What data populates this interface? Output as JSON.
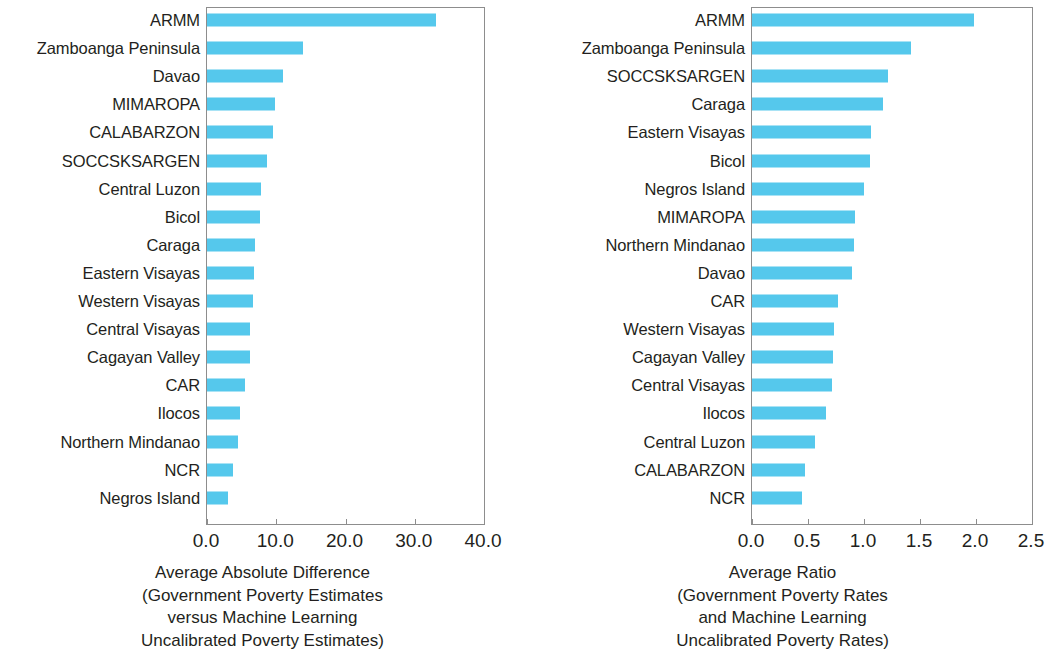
{
  "figure": {
    "background_color": "#ffffff",
    "bar_color": "#55c8ec",
    "axis_color": "#8d8d8d",
    "text_color": "#231f20"
  },
  "chart_data": [
    {
      "type": "bar",
      "orientation": "horizontal",
      "panel": "left",
      "title": "",
      "xlabel": "Average Absolute Difference (Government Poverty Estimates versus Machine Learning Uncalibrated Poverty Estimates)",
      "xlabel_lines": [
        "Average Absolute Difference",
        "(Government Poverty Estimates",
        "versus Machine Learning",
        "Uncalibrated Poverty Estimates)"
      ],
      "ylabel": "",
      "xlim": [
        0.0,
        40.0
      ],
      "xticks": [
        0.0,
        10.0,
        20.0,
        30.0,
        40.0
      ],
      "xtick_labels": [
        "0.0",
        "10.0",
        "20.0",
        "30.0",
        "40.0"
      ],
      "grid": false,
      "legend": null,
      "categories": [
        "ARMM",
        "Zamboanga Peninsula",
        "Davao",
        "MIMAROPA",
        "CALABARZON",
        "SOCCSKSARGEN",
        "Central Luzon",
        "Bicol",
        "Caraga",
        "Eastern Visayas",
        "Western Visayas",
        "Central Visayas",
        "Cagayan Valley",
        "CAR",
        "Ilocos",
        "Northern Mindanao",
        "NCR",
        "Negros Island"
      ],
      "values": [
        33.0,
        13.8,
        11.0,
        9.8,
        9.6,
        8.6,
        7.8,
        7.7,
        7.0,
        6.8,
        6.6,
        6.2,
        6.2,
        5.5,
        4.8,
        4.5,
        3.8,
        3.0
      ]
    },
    {
      "type": "bar",
      "orientation": "horizontal",
      "panel": "right",
      "title": "",
      "xlabel": "Average Ratio (Government Poverty Rates and Machine Learning Uncalibrated Poverty Rates)",
      "xlabel_lines": [
        "Average Ratio",
        "(Government Poverty Rates",
        "and Machine Learning",
        "Uncalibrated Poverty Rates)"
      ],
      "ylabel": "",
      "xlim": [
        0.0,
        2.5
      ],
      "xticks": [
        0.0,
        0.5,
        1.0,
        1.5,
        2.0,
        2.5
      ],
      "xtick_labels": [
        "0.0",
        "0.5",
        "1.0",
        "1.5",
        "2.0",
        "2.5"
      ],
      "grid": false,
      "legend": null,
      "categories": [
        "ARMM",
        "Zamboanga Peninsula",
        "SOCCSKSARGEN",
        "Caraga",
        "Eastern Visayas",
        "Bicol",
        "Negros Island",
        "MIMAROPA",
        "Northern Mindanao",
        "Davao",
        "CAR",
        "Western Visayas",
        "Cagayan Valley",
        "Central Visayas",
        "Ilocos",
        "Central Luzon",
        "CALABARZON",
        "NCR"
      ],
      "values": [
        1.98,
        1.42,
        1.21,
        1.17,
        1.06,
        1.05,
        1.0,
        0.92,
        0.91,
        0.89,
        0.77,
        0.73,
        0.72,
        0.71,
        0.66,
        0.56,
        0.47,
        0.45
      ]
    }
  ]
}
